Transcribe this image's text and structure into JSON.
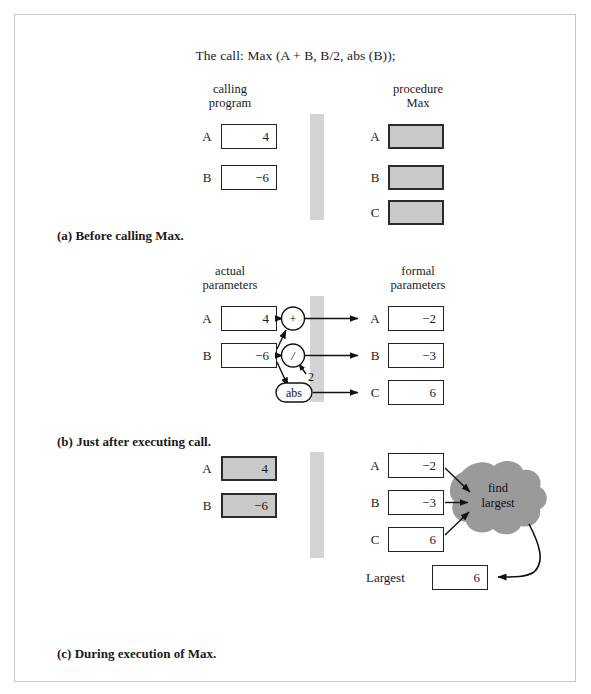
{
  "figure": {
    "call_title": "The call: Max (A + B, B/2, abs (B));"
  },
  "panel_a": {
    "caption_letter": "(a)",
    "caption_text": "Before calling Max.",
    "left_header": "calling\nprogram",
    "right_header": "procedure\nMax",
    "left_rows": [
      {
        "label": "A",
        "value": "4"
      },
      {
        "label": "B",
        "value": "−6"
      }
    ],
    "right_rows": [
      {
        "label": "A",
        "value": ""
      },
      {
        "label": "B",
        "value": ""
      },
      {
        "label": "C",
        "value": ""
      }
    ]
  },
  "panel_b": {
    "caption_letter": "(b)",
    "caption_text": "Just after executing call.",
    "left_header": "actual\nparameters",
    "right_header": "formal\nparameters",
    "left_rows": [
      {
        "label": "A",
        "value": "4"
      },
      {
        "label": "B",
        "value": "−6"
      }
    ],
    "right_rows": [
      {
        "label": "A",
        "value": "−2"
      },
      {
        "label": "B",
        "value": "−3"
      },
      {
        "label": "C",
        "value": "6"
      }
    ],
    "operators": [
      {
        "name": "plus",
        "symbol": "+"
      },
      {
        "name": "divide",
        "symbol": "/"
      },
      {
        "name": "abs",
        "symbol": "abs"
      }
    ],
    "divisor_label": "2"
  },
  "panel_c": {
    "caption_letter": "(c)",
    "caption_text": "During execution of Max.",
    "left_rows": [
      {
        "label": "A",
        "value": "4"
      },
      {
        "label": "B",
        "value": "−6"
      }
    ],
    "right_rows": [
      {
        "label": "A",
        "value": "−2"
      },
      {
        "label": "B",
        "value": "−3"
      },
      {
        "label": "C",
        "value": "6"
      }
    ],
    "cloud_line1": "find",
    "cloud_line2": "largest",
    "result_label": "Largest",
    "result_value": "6"
  },
  "colors": {
    "fill_gray": "#c9c9c9",
    "divider_gray": "#d4d4d4",
    "cloud_gray": "#9a9a9a",
    "border_dark": "#222222",
    "frame": "#c8c8c8"
  }
}
